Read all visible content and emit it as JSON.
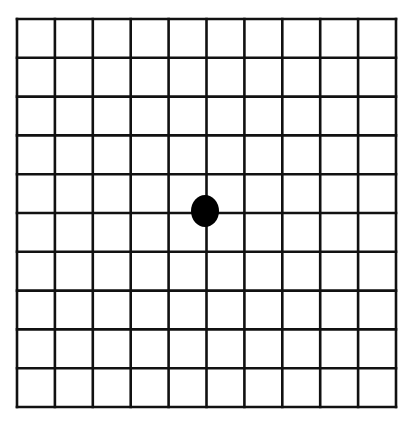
{
  "diagram": {
    "type": "amsler-grid",
    "rows": 10,
    "cols": 10,
    "grid_left": 17,
    "grid_top": 19,
    "grid_right": 396,
    "grid_bottom": 407,
    "line_color": "#111111",
    "line_width": 2.6,
    "center_dot": {
      "cx": 205,
      "cy": 211,
      "rx": 14,
      "ry": 16,
      "color": "#000000"
    }
  }
}
